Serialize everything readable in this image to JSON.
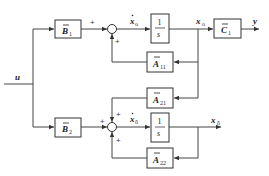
{
  "diagram": {
    "type": "block-diagram",
    "input": {
      "label": "u"
    },
    "output": {
      "label": "y"
    },
    "blocks": [
      {
        "id": "B1",
        "label": "B",
        "sub": "1",
        "bar": true
      },
      {
        "id": "int1",
        "num": "1",
        "den": "s"
      },
      {
        "id": "C1",
        "label": "C",
        "sub": "1",
        "bar": true
      },
      {
        "id": "A11",
        "label": "A",
        "sub": "11",
        "bar": true
      },
      {
        "id": "A21",
        "label": "A",
        "sub": "21",
        "bar": true
      },
      {
        "id": "B2",
        "label": "B",
        "sub": "2",
        "bar": true
      },
      {
        "id": "int2",
        "num": "1",
        "den": "s"
      },
      {
        "id": "A22",
        "label": "A",
        "sub": "22",
        "bar": true
      }
    ],
    "signals": {
      "xo_dot": {
        "label": "x",
        "sub": "o",
        "dot": true
      },
      "xo": {
        "label": "x",
        "sub": "o"
      },
      "xobar_dot": {
        "label": "x",
        "sub": "ō",
        "dot": true
      },
      "xobar": {
        "label": "x",
        "sub": "ō"
      }
    },
    "sum1_signs": [
      "+",
      "+"
    ],
    "sum2_signs": [
      "+",
      "+",
      "+"
    ]
  }
}
